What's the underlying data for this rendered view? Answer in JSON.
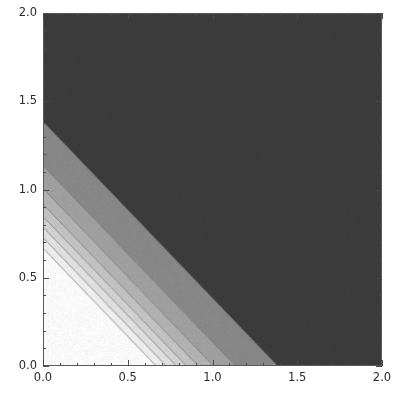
{
  "figure": {
    "width": 401,
    "height": 409,
    "background_color": "#ffffff",
    "frame_color": "#5a5a5a",
    "title": "",
    "tick_label_color": "#2b2b2b"
  },
  "chart_data": {
    "type": "heatmap",
    "subtype": "filled-contour",
    "title": "",
    "subtitle": "",
    "xlabel": "",
    "ylabel": "",
    "xlim": [
      0.0,
      2.0
    ],
    "ylim": [
      0.0,
      2.0
    ],
    "grid": false,
    "legend": "none",
    "colormap": "grayscale",
    "x_major_ticks": [
      0.0,
      0.5,
      1.0,
      1.5,
      2.0
    ],
    "x_major_tick_labels": [
      "0.0",
      "0.5",
      "1.0",
      "1.5",
      "2.0"
    ],
    "y_major_ticks": [
      0.0,
      0.5,
      1.0,
      1.5,
      2.0
    ],
    "y_major_tick_labels": [
      "0.0",
      "0.5",
      "1.0",
      "1.5",
      "2.0"
    ],
    "minor_tick_step": 0.1,
    "contour_variable": "x + y",
    "contour_levels": [
      0.66,
      0.72,
      0.78,
      0.84,
      0.91,
      1.0,
      1.13,
      1.38
    ],
    "band_fills": [
      {
        "from": 0.0,
        "to": 0.66,
        "color": "#ffffff"
      },
      {
        "from": 0.66,
        "to": 0.72,
        "color": "#f2f2f2"
      },
      {
        "from": 0.72,
        "to": 0.78,
        "color": "#e4e4e4"
      },
      {
        "from": 0.78,
        "to": 0.84,
        "color": "#d6d6d6"
      },
      {
        "from": 0.84,
        "to": 0.91,
        "color": "#c6c6c6"
      },
      {
        "from": 0.91,
        "to": 1.0,
        "color": "#b5b5b5"
      },
      {
        "from": 1.0,
        "to": 1.13,
        "color": "#a2a2a2"
      },
      {
        "from": 1.13,
        "to": 1.38,
        "color": "#8a8a8a"
      },
      {
        "from": 1.38,
        "to": 4.0,
        "color": "#3c3c3c"
      }
    ],
    "contour_line_color": "#6e6e6e"
  }
}
